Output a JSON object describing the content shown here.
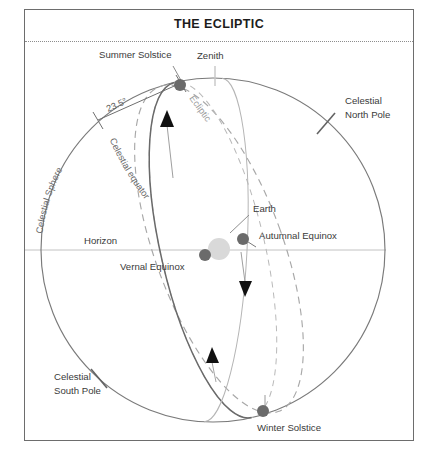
{
  "figure": {
    "title": "THE ECLIPTIC",
    "type": "astronomy-celestial-sphere-diagram"
  },
  "labels": {
    "summer_solstice": "Summer Solstice",
    "winter_solstice": "Winter Solstice",
    "vernal_equinox": "Vernal Equinox",
    "autumnal_equinox": "Autumnal Equinox",
    "zenith": "Zenith",
    "horizon": "Horizon",
    "earth": "Earth",
    "ecliptic": "Ecliptic",
    "celestial_equator": "Celestial equator",
    "celestial_sphere": "Celestial Sphere",
    "celestial_north_pole_line1": "Celestial",
    "celestial_north_pole_line2": "North Pole",
    "celestial_south_pole_line1": "Celestial",
    "celestial_south_pole_line2": "South Pole",
    "tilt_angle": "23.5°"
  },
  "colors": {
    "frame_border": "#6d6d6d",
    "title_text": "#1c1c1c",
    "sphere_outline": "#7a7a7a",
    "celestial_equator": "#6a6a6a",
    "ecliptic_dashed": "#a0a0a0",
    "horizon_line": "#bfbfbf",
    "solstice_equinox_dot": "#6b6b6b",
    "earth_disc": "#d6d6d6",
    "arrowhead": "#111111",
    "label_text": "#3a3a3a",
    "background": "#ffffff"
  },
  "markers": [
    {
      "name": "summer-solstice",
      "x": 180,
      "y": 85,
      "kind": "dot"
    },
    {
      "name": "vernal-equinox",
      "x": 205,
      "y": 255,
      "kind": "dot"
    },
    {
      "name": "autumnal-equinox",
      "x": 243,
      "y": 239,
      "kind": "dot"
    },
    {
      "name": "winter-solstice",
      "x": 263,
      "y": 411,
      "kind": "dot"
    },
    {
      "name": "earth",
      "x": 219,
      "y": 249,
      "kind": "disc"
    }
  ]
}
